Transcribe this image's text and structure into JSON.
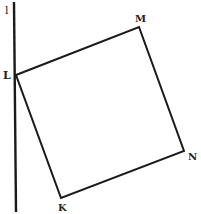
{
  "diagram": {
    "line": {
      "label": "l",
      "x1": 14,
      "y1": 2,
      "x2": 16,
      "y2": 212,
      "label_x": 5,
      "label_y": 14
    },
    "vertices": [
      {
        "name": "L",
        "x": 16,
        "y": 75,
        "label_x": 3,
        "label_y": 79
      },
      {
        "name": "M",
        "x": 139,
        "y": 27,
        "label_x": 135,
        "label_y": 22
      },
      {
        "name": "N",
        "x": 184,
        "y": 151,
        "label_x": 188,
        "label_y": 160
      },
      {
        "name": "K",
        "x": 61,
        "y": 198,
        "label_x": 58,
        "label_y": 211
      }
    ],
    "edges": [
      [
        "L",
        "M"
      ],
      [
        "M",
        "N"
      ],
      [
        "N",
        "K"
      ],
      [
        "K",
        "L"
      ]
    ],
    "colors": {
      "stroke": "#1a1a1a",
      "background": "#ffffff",
      "text": "#222222"
    }
  }
}
